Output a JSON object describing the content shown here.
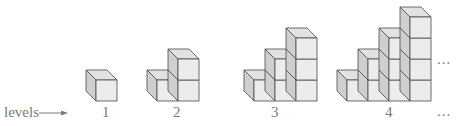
{
  "diagram": {
    "axis_label": "levels",
    "arrow": "right-arrow",
    "levels": [
      {
        "label": "1",
        "columns": [
          1
        ]
      },
      {
        "label": "2",
        "columns": [
          1,
          2
        ]
      },
      {
        "label": "3",
        "columns": [
          1,
          2,
          3
        ]
      },
      {
        "label": "4",
        "columns": [
          1,
          2,
          3,
          4
        ]
      }
    ],
    "continuation_marks": [
      "...",
      "..."
    ],
    "colors": {
      "front": "#ececec",
      "top": "#e2e2e2",
      "side": "#cfcfcf",
      "stroke": "#4a4a4a",
      "text": "#7a7a7a"
    }
  }
}
